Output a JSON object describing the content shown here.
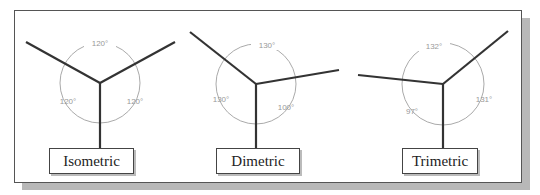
{
  "diagrams": [
    {
      "name": "Isometric",
      "label": "Isometric",
      "angles": {
        "top": "120°",
        "left": "120°",
        "right": "120°"
      }
    },
    {
      "name": "Dimetric",
      "label": "Dimetric",
      "angles": {
        "top": "130°",
        "left": "130°",
        "right": "100°"
      }
    },
    {
      "name": "Trimetric",
      "label": "Trimetric",
      "angles": {
        "top": "132°",
        "left": "97°",
        "right": "131°"
      }
    }
  ],
  "colors": {
    "axis": "#333333",
    "arc": "#aaaaaa",
    "angle_text": "#999999",
    "shadow": "#b8b8b8"
  }
}
